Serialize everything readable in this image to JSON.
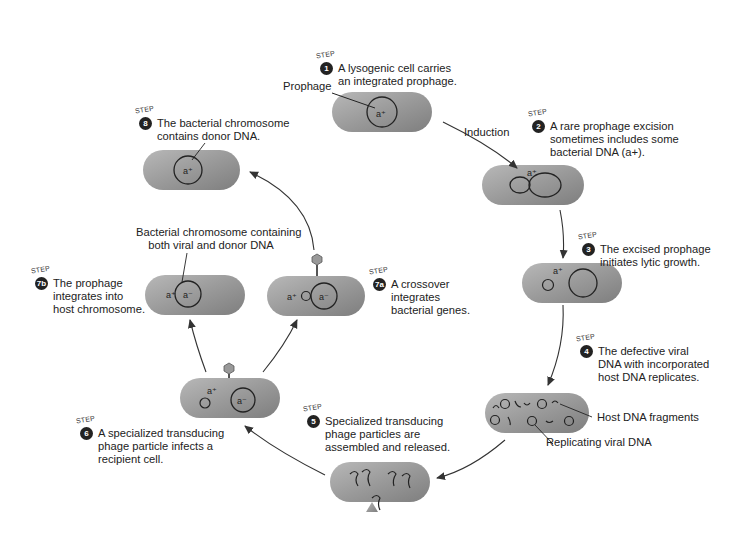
{
  "figure": {
    "step_tag": "STEP",
    "steps": [
      {
        "num": "1",
        "lines": [
          "A lysogenic cell carries",
          "an integrated prophage."
        ]
      },
      {
        "num": "2",
        "lines": [
          "A rare prophage excision",
          "sometimes includes some",
          "bacterial DNA (a+)."
        ]
      },
      {
        "num": "3",
        "lines": [
          "The excised prophage",
          "initiates lytic growth."
        ]
      },
      {
        "num": "4",
        "lines": [
          "The defective viral",
          "DNA with incorporated",
          "host DNA replicates."
        ]
      },
      {
        "num": "5",
        "lines": [
          "Specialized transducing",
          "phage particles are",
          "assembled and released."
        ]
      },
      {
        "num": "6",
        "lines": [
          "A specialized transducing",
          "phage particle infects a",
          "recipient cell."
        ]
      },
      {
        "num": "7a",
        "lines": [
          "A crossover",
          "integrates",
          "bacterial genes."
        ]
      },
      {
        "num": "7b",
        "lines": [
          "The prophage",
          "integrates into",
          "host chromosome."
        ]
      },
      {
        "num": "8",
        "lines": [
          "The bacterial chromosome",
          "contains donor DNA."
        ]
      }
    ],
    "callouts": {
      "prophage": "Prophage",
      "induction": "Induction",
      "host_dna_fragments": "Host DNA fragments",
      "replicating_viral_dna": "Replicating viral DNA",
      "chromosome_both_line1": "Bacterial chromosome containing",
      "chromosome_both_line2": "both viral and donor DNA"
    },
    "gene_labels": {
      "a_plus": "a+",
      "a_minus": "a−"
    }
  }
}
